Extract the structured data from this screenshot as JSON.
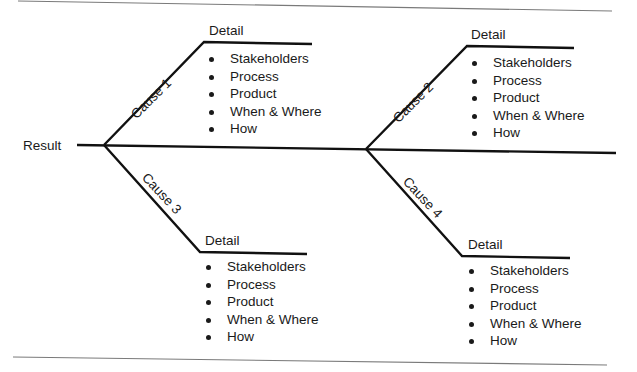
{
  "diagram": {
    "type": "fishbone / cause-and-effect",
    "result_label": "Result",
    "causes": [
      {
        "label": "Cause 1",
        "detail_label": "Detail",
        "items": [
          "Stakeholders",
          "Process",
          "Product",
          "When & Where",
          "How"
        ]
      },
      {
        "label": "Cause 2",
        "detail_label": "Detail",
        "items": [
          "Stakeholders",
          "Process",
          "Product",
          "When & Where",
          "How"
        ]
      },
      {
        "label": "Cause 3",
        "detail_label": "Detail",
        "items": [
          "Stakeholders",
          "Process",
          "Product",
          "When & Where",
          "How"
        ]
      },
      {
        "label": "Cause 4",
        "detail_label": "Detail",
        "items": [
          "Stakeholders",
          "Process",
          "Product",
          "When & Where",
          "How"
        ]
      }
    ]
  },
  "colors": {
    "line": "#111111",
    "rule": "#777777",
    "text": "#1a1a1a",
    "background": "#ffffff"
  }
}
